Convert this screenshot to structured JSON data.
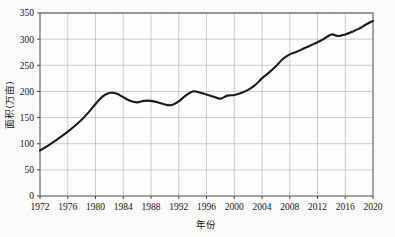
{
  "chart_data": {
    "type": "line",
    "title": "",
    "subtitle": "",
    "xlabel": "年份",
    "ylabel": "面积(万亩)",
    "xlim": [
      1972,
      2020
    ],
    "ylim": [
      0,
      350
    ],
    "grid": true,
    "legend": null,
    "legend_position": "none",
    "line_color": "#1a1a1a",
    "grid_color": "#b7b7b7",
    "axis_color": "#4a4a4a",
    "background_color": "#fbfbfa",
    "xticks": [
      1972,
      1976,
      1980,
      1984,
      1988,
      1992,
      1996,
      2000,
      2004,
      2008,
      2012,
      2016,
      2020
    ],
    "xtick_labels": [
      "1972",
      "1976",
      "1980",
      "1984",
      "1988",
      "1992",
      "1996",
      "2000",
      "2004",
      "2008",
      "2012",
      "2016",
      "2020"
    ],
    "yticks": [
      0,
      50,
      100,
      150,
      200,
      250,
      300,
      350
    ],
    "ytick_labels": [
      "0",
      "50",
      "100",
      "150",
      "200",
      "250",
      "300",
      "350"
    ],
    "x": [
      1972,
      1973,
      1974,
      1975,
      1976,
      1977,
      1978,
      1979,
      1980,
      1981,
      1982,
      1983,
      1984,
      1985,
      1986,
      1987,
      1988,
      1989,
      1990,
      1991,
      1992,
      1993,
      1994,
      1995,
      1996,
      1997,
      1998,
      1999,
      2000,
      2001,
      2002,
      2003,
      2004,
      2005,
      2006,
      2007,
      2008,
      2009,
      2010,
      2011,
      2012,
      2013,
      2014,
      2015,
      2016,
      2017,
      2018,
      2019,
      2020
    ],
    "series": [
      {
        "name": "面积(万亩)",
        "values": [
          87,
          95,
          104,
          113,
          123,
          134,
          146,
          160,
          176,
          190,
          197,
          196,
          189,
          182,
          179,
          182,
          182,
          179,
          175,
          174,
          181,
          192,
          200,
          198,
          194,
          190,
          186,
          192,
          193,
          197,
          203,
          212,
          225,
          236,
          248,
          262,
          271,
          276,
          282,
          288,
          294,
          301,
          309,
          306,
          309,
          314,
          320,
          328,
          335
        ]
      }
    ]
  }
}
